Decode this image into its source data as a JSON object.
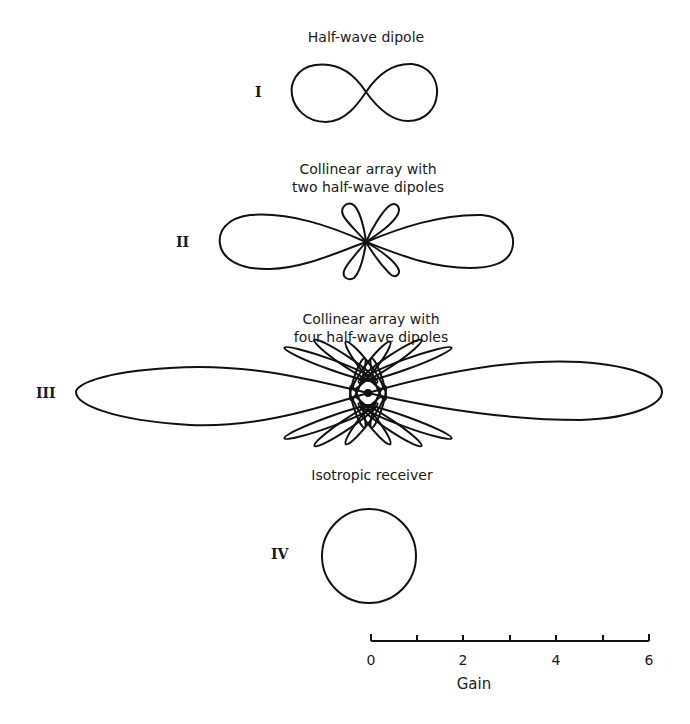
{
  "patterns": [
    {
      "roman": "I",
      "title_lines": [
        "Half-wave dipole"
      ],
      "type": "figure-eight",
      "center": [
        366,
        92
      ]
    },
    {
      "roman": "II",
      "title_lines": [
        "Collinear array with",
        "two half-wave dipoles"
      ],
      "type": "two-lobe-main-with-side-lobes",
      "center": [
        366,
        242
      ]
    },
    {
      "roman": "III",
      "title_lines": [
        "Collinear array with",
        "four half-wave dipoles"
      ],
      "type": "two-lobe-main-with-many-side-lobes",
      "center": [
        368,
        393
      ]
    },
    {
      "roman": "IV",
      "title_lines": [
        "Isotropic receiver"
      ],
      "type": "circle",
      "center": [
        369,
        556
      ]
    }
  ],
  "scale": {
    "axis_title": "Gain",
    "tick_labels": [
      "0",
      "2",
      "4",
      "6"
    ],
    "tick_count": 7,
    "min": 0,
    "max": 6
  },
  "colors": {
    "stroke": "#111111",
    "background": "#ffffff"
  }
}
